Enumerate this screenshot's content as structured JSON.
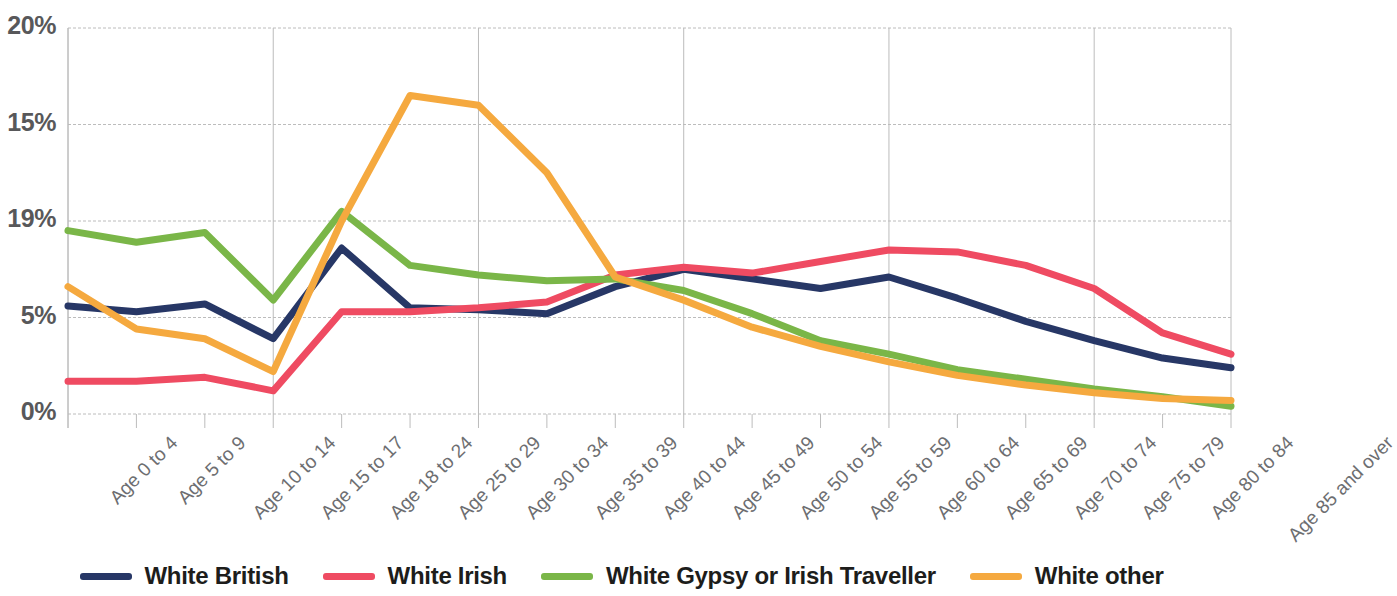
{
  "chart_data": {
    "type": "line",
    "title": "",
    "xlabel": "",
    "ylabel": "",
    "ylim": [
      0,
      20
    ],
    "grid": true,
    "legend_position": "bottom",
    "y_tick_labels": [
      "20%",
      "15%",
      "19%",
      "5%",
      "0%"
    ],
    "y_tick_values": [
      20,
      15,
      10,
      5,
      0
    ],
    "categories": [
      "Age 0 to 4",
      "Age 5 to 9",
      "Age 10 to 14",
      "Age 15 to 17",
      "Age 18 to 24",
      "Age 25 to 29",
      "Age 30 to 34",
      "Age 35 to 39",
      "Age 40 to 44",
      "Age 45 to 49",
      "Age 50 to 54",
      "Age 55 to 59",
      "Age 60 to 64",
      "Age 65 to 69",
      "Age 70 to 74",
      "Age 75 to 79",
      "Age 80 to 84",
      "Age 85 and over"
    ],
    "series": [
      {
        "name": "White British",
        "color": "#273766",
        "values": [
          5.6,
          5.3,
          5.7,
          3.9,
          8.6,
          5.5,
          5.4,
          5.2,
          6.6,
          7.5,
          7.0,
          6.5,
          7.1,
          6.0,
          4.8,
          3.8,
          2.9,
          2.4
        ]
      },
      {
        "name": "White Irish",
        "color": "#ef4b62",
        "values": [
          1.7,
          1.7,
          1.9,
          1.2,
          5.3,
          5.3,
          5.5,
          5.8,
          7.2,
          7.6,
          7.3,
          7.9,
          8.5,
          8.4,
          7.7,
          6.5,
          4.2,
          3.1
        ]
      },
      {
        "name": "White Gypsy or Irish Traveller",
        "color": "#7ab648",
        "values": [
          9.5,
          8.9,
          9.4,
          5.9,
          10.5,
          7.7,
          7.2,
          6.9,
          7.0,
          6.4,
          5.2,
          3.8,
          3.1,
          2.3,
          1.8,
          1.3,
          0.9,
          0.4
        ]
      },
      {
        "name": "White other",
        "color": "#f5a93f",
        "values": [
          6.6,
          4.4,
          3.9,
          2.2,
          10.0,
          16.5,
          16.0,
          12.5,
          7.1,
          5.9,
          4.5,
          3.5,
          2.7,
          2.0,
          1.5,
          1.1,
          0.8,
          0.7
        ]
      }
    ]
  },
  "legend": {
    "items": [
      {
        "label": "White British",
        "color": "#273766"
      },
      {
        "label": "White Irish",
        "color": "#ef4b62"
      },
      {
        "label": "White Gypsy or Irish Traveller",
        "color": "#7ab648"
      },
      {
        "label": "White other",
        "color": "#f5a93f"
      }
    ]
  },
  "axis": {
    "y_ticks": [
      "20%",
      "15%",
      "19%",
      "5%",
      "0%"
    ]
  },
  "colors": {
    "grid": "#bcbcbc",
    "axis_text": "#6d6e71",
    "y_axis_text": "#58585a",
    "legend_text": "#1d1d1b",
    "background": "#ffffff"
  }
}
